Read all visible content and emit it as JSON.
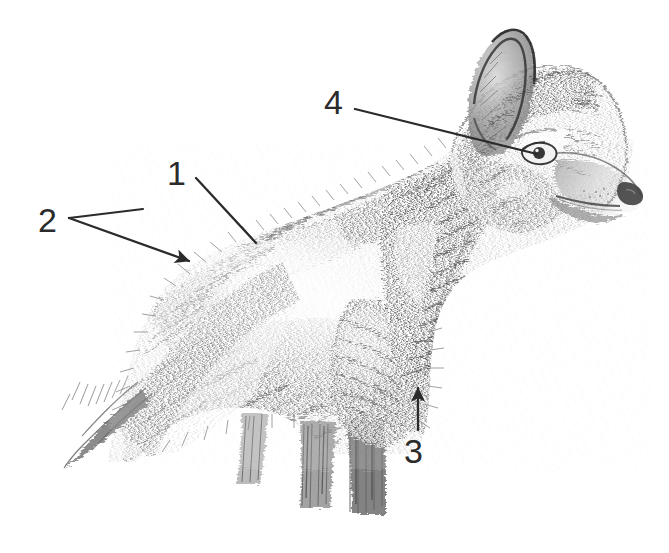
{
  "figure": {
    "kind": "pencil-illustration",
    "subject": "wolf",
    "view": "left profile, head and forequarters, facing right",
    "background_color": "#ffffff",
    "ink_color": "#2b2b2b",
    "graphite_light": "#b9b9b9",
    "graphite_mid": "#7d7d7d",
    "graphite_dark": "#4a4a4a",
    "width": 669,
    "height": 553
  },
  "labels": [
    {
      "id": "1",
      "text": "1",
      "text_x": 178,
      "text_y": 176,
      "leader": {
        "from_x": 196,
        "from_y": 178,
        "to_x": 256,
        "to_y": 243
      },
      "arrowhead": "none"
    },
    {
      "id": "2",
      "text": "2",
      "text_x": 50,
      "text_y": 223,
      "leader": {
        "from_x": 69,
        "from_y": 218,
        "to_x": 189,
        "to_y": 261
      },
      "branch": {
        "from_x": 69,
        "from_y": 218,
        "to_x": 143,
        "to_y": 209
      },
      "arrowhead": "filled-triangle"
    },
    {
      "id": "3",
      "text": "3",
      "text_x": 415,
      "text_y": 453,
      "leader": {
        "from_x": 418,
        "from_y": 428,
        "to_x": 418,
        "to_y": 386
      },
      "arrowhead": "filled-triangle"
    },
    {
      "id": "4",
      "text": "4",
      "text_x": 336,
      "text_y": 105,
      "leader": {
        "from_x": 355,
        "from_y": 109,
        "to_x": 537,
        "to_y": 154
      },
      "arrowhead": "none"
    }
  ],
  "alt_text": "Graphite pencil drawing of a wolf in left profile facing right, with four numbered leader lines pointing to the back fur, the rump fur, the chest behind the foreleg, and the eye."
}
